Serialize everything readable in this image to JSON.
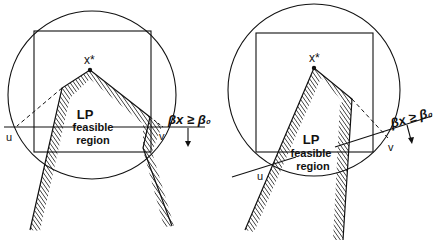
{
  "figures": [
    {
      "id": "left",
      "optimum_label": "x*",
      "region_label_line1": "LP",
      "region_label_line2": "feasible",
      "region_label_line3": "region",
      "point_u": "u",
      "point_v": "v",
      "cut_label": "βx ≥ β₀"
    },
    {
      "id": "right",
      "optimum_label": "x*",
      "region_label_line1": "LP",
      "region_label_line2": "feasible",
      "region_label_line3": "region",
      "point_u": "u",
      "point_v": "v",
      "cut_label": "βx ≥ β₀"
    }
  ],
  "colors": {
    "ink": "#111111",
    "background": "#ffffff"
  }
}
